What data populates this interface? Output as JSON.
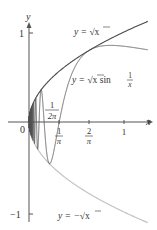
{
  "diagram": {
    "type": "function-graph",
    "axes": {
      "x_label": "x",
      "y_label": "y",
      "origin_label": "0",
      "x_ticks": [
        {
          "value": 0.3183,
          "num": "1",
          "den": "π"
        },
        {
          "value": 0.6366,
          "num": "2",
          "den": "π"
        },
        {
          "value": 1,
          "label": "1"
        }
      ],
      "x_annotation": {
        "value": 0.1592,
        "num": "1",
        "den": "2π"
      },
      "y_ticks": [
        {
          "value": 1,
          "label": "1"
        },
        {
          "value": -1,
          "label": "−1"
        }
      ]
    },
    "curves": [
      {
        "name": "upper-envelope",
        "label_prefix": "y = ",
        "label_math": "√x",
        "color": "#4a4a4a"
      },
      {
        "name": "oscillating",
        "label_prefix": "y = ",
        "label_math": "√x sin",
        "label_frac_num": "1",
        "label_frac_den": "x",
        "color": "#555555"
      },
      {
        "name": "lower-envelope",
        "label_prefix": "y = −",
        "label_math": "√x",
        "color": "#bdbdbd"
      }
    ],
    "colors": {
      "axis": "#555555",
      "upper": "#4a4a4a",
      "oscillating": "#555555",
      "lower": "#c4c4c4",
      "text": "#333333"
    }
  }
}
